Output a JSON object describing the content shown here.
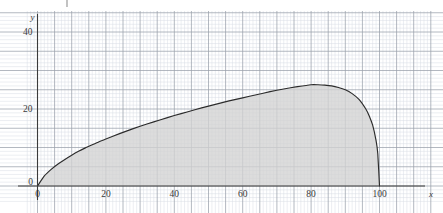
{
  "chart_data": {
    "type": "area",
    "title": "",
    "subtitle": "",
    "xlabel": "x",
    "ylabel": "y",
    "xlim": [
      -3,
      115
    ],
    "ylim": [
      -4,
      48
    ],
    "xticks": [
      0,
      20,
      40,
      60,
      80,
      100
    ],
    "xticklabels": [
      "0",
      "20",
      "40",
      "60",
      "80",
      "100"
    ],
    "yticks": [
      0,
      20,
      40
    ],
    "yticklabels": [
      "0",
      "20",
      "40"
    ],
    "grid": true,
    "grid_minor_step_x": 1,
    "grid_minor_step_y": 1,
    "grid_major_step_x": 5,
    "grid_major_step_y": 5,
    "legend": null,
    "fill": true,
    "fill_color": "#d2d2d2",
    "line_color": "#2b2b2b",
    "grid_minor_color": "#d9dde4",
    "grid_major_color": "#9aa0ab",
    "axis_color": "#3a3a3a",
    "x": [
      0,
      2,
      4,
      6,
      8,
      10,
      12,
      14,
      16,
      18,
      20,
      24,
      28,
      32,
      36,
      40,
      44,
      48,
      52,
      56,
      60,
      64,
      68,
      72,
      76,
      80,
      82,
      84,
      86,
      88,
      90,
      92,
      94,
      96,
      97,
      98,
      99,
      99.5,
      100
    ],
    "y": [
      0,
      2.6,
      4.3,
      5.7,
      6.9,
      8.0,
      9.0,
      9.9,
      10.7,
      11.5,
      12.2,
      13.6,
      14.9,
      16.1,
      17.2,
      18.3,
      19.3,
      20.3,
      21.2,
      22.1,
      22.9,
      23.7,
      24.5,
      25.2,
      25.8,
      26.3,
      26.3,
      26.2,
      26.0,
      25.6,
      25.0,
      24.0,
      22.5,
      20.0,
      18.2,
      15.8,
      11.8,
      8.4,
      0
    ],
    "annotations": [
      {
        "name": "stray-tick-mark",
        "x_px": 67,
        "y_px": 0,
        "height_px": 7,
        "color": "#9a9a9a"
      }
    ]
  },
  "axis": {
    "y_name": "y",
    "x_name": "x",
    "origin_label": "0"
  }
}
